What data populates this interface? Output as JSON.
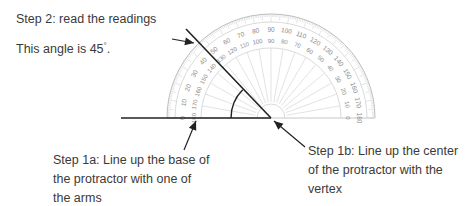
{
  "step2": {
    "title": "Step 2: read the readings",
    "angle_prefix": "This angle is 45",
    "angle_suffix": "."
  },
  "step1a": {
    "lines": [
      "Step 1a: Line up the base of",
      "the protractor with one of",
      "the arms"
    ]
  },
  "step1b": {
    "lines": [
      "Step 1b: Line up the center",
      "of the protractor with the",
      "vertex"
    ]
  },
  "protractor": {
    "outer_scale": [
      "0",
      "10",
      "20",
      "30",
      "40",
      "50",
      "60",
      "70",
      "80",
      "90",
      "100",
      "110",
      "120",
      "130",
      "140",
      "150",
      "160",
      "170",
      "180"
    ],
    "inner_scale": [
      "180",
      "170",
      "160",
      "150",
      "140",
      "130",
      "120",
      "110",
      "100",
      "90",
      "80",
      "70",
      "60",
      "50",
      "40",
      "30",
      "20",
      "10",
      "0"
    ]
  },
  "angle_degrees": 45,
  "colors": {
    "line": "#222222",
    "protractor": "#bdbdbd",
    "scale_text": "#8a8a8a",
    "text": "#3a3a3a"
  }
}
